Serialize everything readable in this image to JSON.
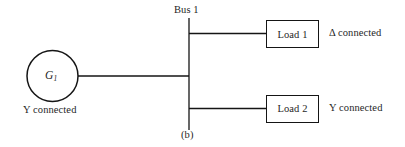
{
  "figure": {
    "panel_label": "(b)",
    "bus": {
      "label": "Bus 1"
    },
    "generator": {
      "symbol_name": "G",
      "symbol_subscript": "1",
      "note": "Y connected"
    },
    "loads": [
      {
        "label": "Load 1",
        "note": "Δ connected"
      },
      {
        "label": "Load 2",
        "note": "Y connected"
      }
    ],
    "colors": {
      "background": "#ffffff",
      "stroke": "#151515",
      "text": "#1f1f1f"
    }
  }
}
